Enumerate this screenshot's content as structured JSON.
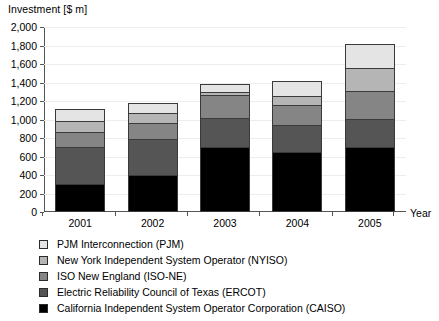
{
  "chart_data": {
    "type": "bar",
    "subtype": "stacked-vertical",
    "title": "",
    "ylabel": "Investment [$ m]",
    "xlabel": "Year",
    "categories": [
      "2001",
      "2002",
      "2003",
      "2004",
      "2005"
    ],
    "ylim": [
      0,
      2000
    ],
    "ytick_step": 200,
    "ytick_labels": [
      "0",
      "200",
      "400",
      "600",
      "800",
      "1,000",
      "1,200",
      "1,400",
      "1,600",
      "1,800",
      "2,000"
    ],
    "ytick_values": [
      0,
      200,
      400,
      600,
      800,
      1000,
      1200,
      1400,
      1600,
      1800,
      2000
    ],
    "grid": true,
    "legend_position": "below",
    "stack_order_bottom_to_top": [
      "CAISO",
      "ERCOT",
      "ISO-NE",
      "NYISO",
      "PJM"
    ],
    "series": [
      {
        "name": "California Independent System Operator Corporation (CAISO)",
        "short": "CAISO",
        "color": "#000000",
        "values": [
          300,
          400,
          700,
          650,
          700
        ]
      },
      {
        "name": "Electric Reliability Council of Texas (ERCOT)",
        "short": "ERCOT",
        "color": "#555555",
        "values": [
          410,
          405,
          330,
          300,
          320
        ]
      },
      {
        "name": "ISO New England (ISO-NE)",
        "short": "ISO-NE",
        "color": "#858585",
        "values": [
          180,
          180,
          260,
          230,
          310
        ]
      },
      {
        "name": "New York Independent System Operator (NYISO)",
        "short": "NYISO",
        "color": "#b5b5b5",
        "values": [
          130,
          115,
          40,
          110,
          260
        ]
      },
      {
        "name": "PJM Interconnection (PJM)",
        "short": "PJM",
        "color": "#e4e4e4",
        "values": [
          140,
          120,
          95,
          170,
          270
        ]
      }
    ],
    "totals": [
      1160,
      1220,
      1425,
      1460,
      1860
    ],
    "cumulative_tops": {
      "2001": [
        300,
        710,
        890,
        1020,
        1160
      ],
      "2002": [
        400,
        805,
        985,
        1100,
        1220
      ],
      "2003": [
        700,
        1030,
        1290,
        1330,
        1425
      ],
      "2004": [
        650,
        950,
        1180,
        1290,
        1460
      ],
      "2005": [
        700,
        1020,
        1330,
        1590,
        1860
      ]
    }
  },
  "legend": {
    "items": [
      {
        "label": "PJM Interconnection (PJM)",
        "color": "#e4e4e4"
      },
      {
        "label": "New York Independent System Operator (NYISO)",
        "color": "#b5b5b5"
      },
      {
        "label": "ISO New England (ISO-NE)",
        "color": "#858585"
      },
      {
        "label": "Electric Reliability Council of Texas (ERCOT)",
        "color": "#555555"
      },
      {
        "label": "California Independent System Operator Corporation (CAISO)",
        "color": "#000000"
      }
    ]
  }
}
